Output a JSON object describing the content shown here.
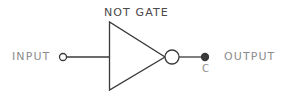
{
  "diagram": {
    "title": "NOT GATE",
    "input_label": "INPUT",
    "output_label": "OUTPUT",
    "output_node_label": "C",
    "colors": {
      "background": "#ffffff",
      "stroke": "#3a3a3a",
      "title_text": "#4a4a4a",
      "label_text": "#8c8c8c",
      "terminal_fill_open": "#ffffff",
      "terminal_fill_solid": "#3a3a3a"
    },
    "geometry": {
      "canvas_width": 285,
      "canvas_height": 100,
      "signal_y": 57,
      "triangle_left_x": 109,
      "triangle_top_y": 22,
      "triangle_bottom_y": 90,
      "triangle_apex_x": 165,
      "bubble_center_x": 172,
      "bubble_radius": 7,
      "input_terminal_x": 63,
      "input_terminal_radius": 3.5,
      "output_terminal_x": 205,
      "output_terminal_radius": 3.5,
      "stroke_width": 1.3
    }
  }
}
